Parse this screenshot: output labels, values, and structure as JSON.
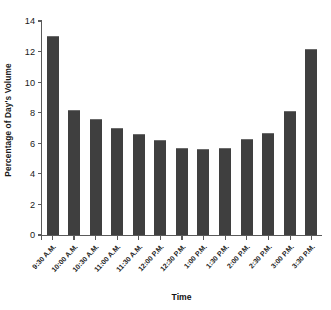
{
  "chart_data": {
    "type": "bar",
    "title": "",
    "xlabel": "Time",
    "ylabel": "Percentage of Day's Volume",
    "categories": [
      "9:30 A.M.",
      "10:00 A.M.",
      "10:30 A.M.",
      "11:00 A.M.",
      "11:30 A.M.",
      "12:00 P.M.",
      "12:30 P.M.",
      "1:00 P.M.",
      "1:30 P.M.",
      "2:00 P.M.",
      "2:30 P.M.",
      "3:00 P.M.",
      "3:30 P.M."
    ],
    "values": [
      13.0,
      8.2,
      7.6,
      7.0,
      6.6,
      6.2,
      5.7,
      5.6,
      5.7,
      6.3,
      6.7,
      8.1,
      12.2
    ],
    "ylim": [
      0,
      14
    ],
    "yticks": [
      0,
      2,
      4,
      6,
      8,
      10,
      12,
      14
    ],
    "ytick_labels": [
      "0",
      "2",
      "4",
      "6",
      "8",
      "10",
      "12",
      "14"
    ],
    "grid": false,
    "legend": null,
    "bar_color": "#3f3f3f",
    "axis_color": "#5a5a5a",
    "background": "#ffffff"
  }
}
